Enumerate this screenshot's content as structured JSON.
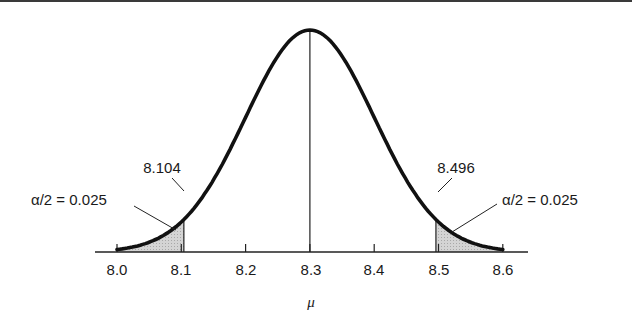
{
  "figure": {
    "type": "normal-distribution-confidence-interval",
    "x_axis_label": "μ",
    "tick_labels": [
      "8.0",
      "8.1",
      "8.2",
      "8.3",
      "8.4",
      "8.5",
      "8.6"
    ],
    "lower_bound_label": "8.104",
    "upper_bound_label": "8.496",
    "left_tail_label": "α/2 = 0.025",
    "right_tail_label": "α/2 = 0.025",
    "center": 8.3,
    "lower_bound": 8.104,
    "upper_bound": 8.496,
    "tail_area": 0.025
  },
  "style": {
    "curve_color": "#111111",
    "shade_color": "#c8c8c8",
    "axis_color": "#222222"
  }
}
